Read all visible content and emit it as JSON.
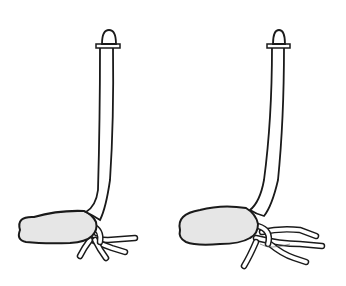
{
  "figure": {
    "colors": {
      "line": "#1a1a1a",
      "seed_fill": "#e6e6e6",
      "background": "#ffffff"
    },
    "panels": [
      {
        "id": "left-seedling",
        "roots_count": 4
      },
      {
        "id": "right-seedling",
        "roots_count": 5
      }
    ]
  }
}
